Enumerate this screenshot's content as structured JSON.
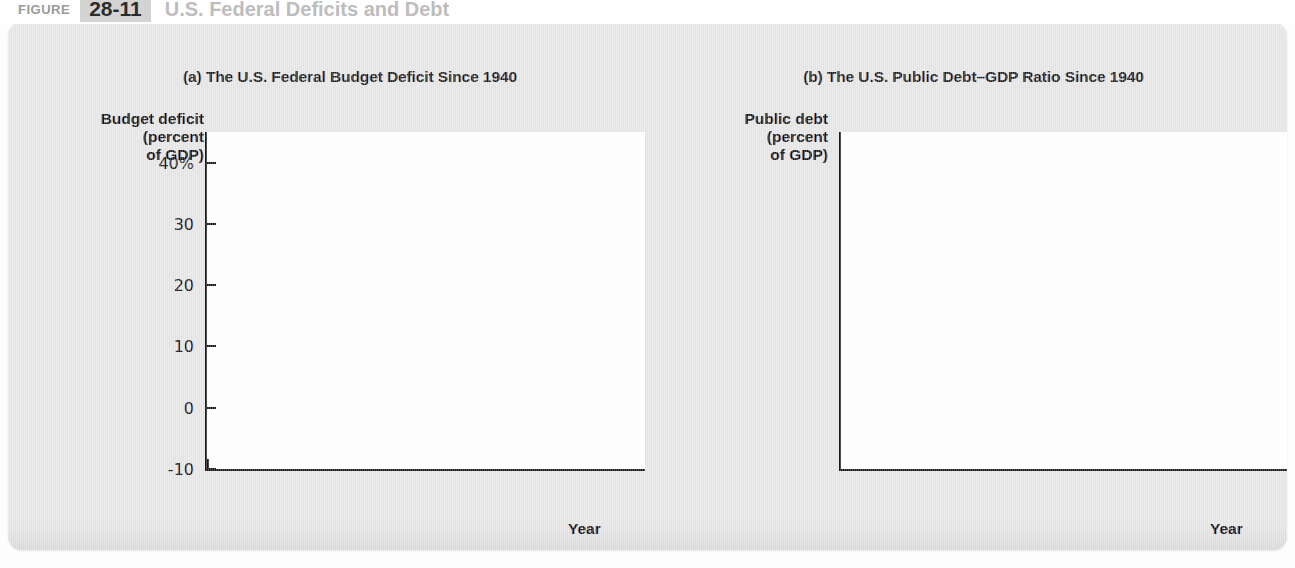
{
  "figure": {
    "label": "Figure",
    "number": "28-11",
    "title": "U.S. Federal Deficits and Debt"
  },
  "axis_title": "Year",
  "panel_a": {
    "subtitle": "(a) The U.S. Federal Budget Deficit Since 1940",
    "ylabel": "Budget deficit\n(percent\nof GDP)",
    "yticks": [
      "40%",
      "30",
      "20",
      "10",
      "0",
      "-10"
    ],
    "xticks": [
      "1940",
      "1950",
      "1960",
      "1970",
      "1980",
      "1990",
      "2000",
      "2011"
    ],
    "line_color": "#272727"
  },
  "panel_b": {
    "subtitle": "(b) The U.S. Public Debt–GDP Ratio Since 1940",
    "ylabel": "Public debt\n(percent\nof GDP)",
    "yticks": [
      "120%",
      "100",
      "80",
      "60",
      "40",
      "20"
    ],
    "xticks": [
      "1940",
      "1950",
      "1960",
      "1970",
      "1980",
      "1990",
      "2000",
      "2011"
    ],
    "line_color": "#4a4a4a"
  },
  "chart_data": [
    {
      "type": "line",
      "id": "panel-a",
      "title": "(a) The U.S. Federal Budget Deficit Since 1940",
      "xlabel": "Year",
      "ylabel": "Budget deficit (percent of GDP)",
      "xlim": [
        1940,
        2011
      ],
      "ylim": [
        -10,
        45
      ],
      "ytick_values": [
        40,
        30,
        20,
        10,
        0,
        -10
      ],
      "ytick_labels": [
        "40%",
        "30",
        "20",
        "10",
        "0",
        "-10"
      ],
      "xtick_values": [
        1940,
        1950,
        1960,
        1970,
        1980,
        1990,
        2000,
        2011
      ],
      "grid": false,
      "legend": "none",
      "zero_line": 0,
      "x": [
        1940,
        1941,
        1942,
        1943,
        1944,
        1945,
        1946,
        1947,
        1948,
        1949,
        1950,
        1951,
        1952,
        1953,
        1954,
        1955,
        1956,
        1957,
        1958,
        1959,
        1960,
        1961,
        1962,
        1963,
        1964,
        1965,
        1966,
        1967,
        1968,
        1969,
        1970,
        1971,
        1972,
        1973,
        1974,
        1975,
        1976,
        1977,
        1978,
        1979,
        1980,
        1981,
        1982,
        1983,
        1984,
        1985,
        1986,
        1987,
        1988,
        1989,
        1990,
        1991,
        1992,
        1993,
        1994,
        1995,
        1996,
        1997,
        1998,
        1999,
        2000,
        2001,
        2002,
        2003,
        2004,
        2005,
        2006,
        2007,
        2008,
        2009,
        2010,
        2011
      ],
      "y": [
        3.0,
        4.3,
        12.7,
        26.9,
        30.6,
        22.4,
        21.5,
        7.2,
        -1.7,
        -4.5,
        1.1,
        -1.9,
        0.3,
        1.7,
        0.3,
        0.7,
        -0.9,
        -0.7,
        0.6,
        2.5,
        -0.1,
        0.6,
        1.2,
        0.8,
        0.9,
        0.2,
        0.5,
        1.0,
        2.8,
        -0.3,
        0.3,
        2.0,
        1.9,
        1.1,
        0.4,
        3.3,
        4.1,
        2.6,
        2.6,
        1.6,
        2.6,
        2.5,
        3.9,
        5.9,
        4.7,
        5.0,
        4.9,
        3.1,
        3.0,
        2.7,
        3.7,
        4.4,
        4.5,
        3.8,
        2.8,
        2.2,
        1.3,
        0.3,
        -0.8,
        -1.3,
        -2.4,
        -1.2,
        1.5,
        3.3,
        3.4,
        2.5,
        1.8,
        1.1,
        3.1,
        9.8,
        8.7,
        10.0
      ],
      "series_label": "Federal budget deficit as a percent of GDP"
    },
    {
      "type": "line",
      "id": "panel-b",
      "title": "(b) The U.S. Public Debt–GDP Ratio Since 1940",
      "xlabel": "Year",
      "ylabel": "Public debt (percent of GDP)",
      "xlim": [
        1940,
        2011
      ],
      "ylim": [
        10,
        128
      ],
      "ytick_values": [
        120,
        100,
        80,
        60,
        40,
        20
      ],
      "ytick_labels": [
        "120%",
        "100",
        "80",
        "60",
        "40",
        "20"
      ],
      "xtick_values": [
        1940,
        1950,
        1960,
        1970,
        1980,
        1990,
        2000,
        2011
      ],
      "grid": false,
      "legend": "none",
      "x": [
        1940,
        1941,
        1942,
        1943,
        1944,
        1945,
        1946,
        1947,
        1948,
        1949,
        1950,
        1951,
        1952,
        1953,
        1954,
        1955,
        1956,
        1957,
        1958,
        1959,
        1960,
        1961,
        1962,
        1963,
        1964,
        1965,
        1966,
        1967,
        1968,
        1969,
        1970,
        1971,
        1972,
        1973,
        1974,
        1975,
        1976,
        1977,
        1978,
        1979,
        1980,
        1981,
        1982,
        1983,
        1984,
        1985,
        1986,
        1987,
        1988,
        1989,
        1990,
        1991,
        1992,
        1993,
        1994,
        1995,
        1996,
        1997,
        1998,
        1999,
        2000,
        2001,
        2002,
        2003,
        2004,
        2005,
        2006,
        2007,
        2008,
        2009,
        2010,
        2011
      ],
      "y": [
        43.0,
        42.3,
        46.0,
        69.0,
        88.0,
        103.9,
        108.6,
        95.5,
        82.4,
        79.0,
        80.2,
        66.9,
        61.6,
        58.6,
        59.5,
        57.2,
        52.0,
        48.7,
        49.2,
        47.9,
        45.6,
        45.0,
        43.7,
        42.4,
        40.0,
        38.0,
        34.9,
        32.9,
        33.3,
        29.3,
        28.0,
        28.1,
        27.4,
        26.0,
        23.9,
        25.3,
        27.5,
        27.8,
        27.4,
        25.6,
        26.1,
        25.8,
        28.7,
        33.1,
        34.0,
        36.4,
        39.6,
        40.6,
        40.9,
        40.6,
        42.1,
        45.3,
        48.1,
        49.3,
        49.2,
        49.1,
        48.4,
        45.9,
        43.0,
        39.4,
        34.7,
        32.5,
        33.6,
        35.6,
        36.8,
        36.9,
        36.5,
        36.2,
        40.5,
        54.1,
        62.8,
        72.0
      ],
      "series_label": "Public debt as a percent of GDP"
    }
  ]
}
